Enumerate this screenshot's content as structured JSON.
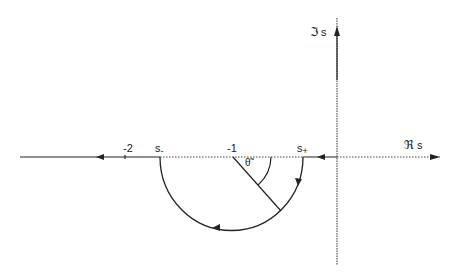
{
  "diagram": {
    "type": "root locus in complex s-plane",
    "axes": {
      "real_label_symbol": "ℜ",
      "real_label_var": "s",
      "imag_label_symbol": "ℑ",
      "imag_label_var": "s"
    },
    "ticks": [
      {
        "label": "-2",
        "value": -2
      },
      {
        "label": "-1",
        "value": -1
      }
    ],
    "points": {
      "s_minus": {
        "base": "s",
        "sub": "-"
      },
      "s_plus": {
        "base": "s",
        "sub": "+"
      }
    },
    "angle_label": "θ̃",
    "color": "#222222"
  }
}
